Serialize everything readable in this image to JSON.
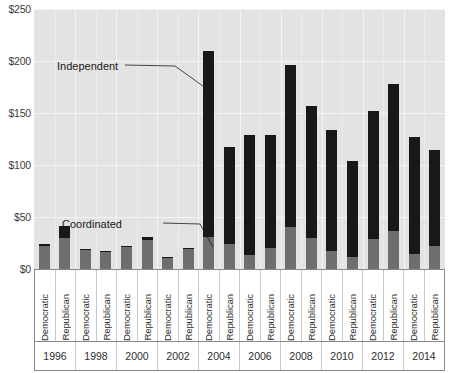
{
  "chart": {
    "type": "bar",
    "title": "",
    "xlabel": "",
    "ylabel": "",
    "axis": {
      "y_ticks": [
        "$0",
        "$50",
        "$100",
        "$150",
        "$200",
        "$250"
      ],
      "y_tick_values": [
        0,
        50,
        100,
        150,
        200,
        250
      ],
      "ylim": [
        0,
        250
      ],
      "grid": "horizontal-and-vertical"
    },
    "annotations": [
      {
        "name": "independent",
        "text": "Independent"
      },
      {
        "name": "coordinated",
        "text": "Coordinated"
      }
    ],
    "colors": {
      "independent": "#181818",
      "coordinated": "#6e6e6e",
      "plot_background": "#e3e3e3",
      "gridline": "#f4f4f4"
    }
  },
  "chart_data": {
    "type": "bar",
    "stacked": true,
    "title": "",
    "xlabel": "",
    "ylabel": "",
    "ylim": [
      0,
      250
    ],
    "ytick_labels": [
      "$0",
      "$50",
      "$100",
      "$150",
      "$200",
      "$250"
    ],
    "grid": true,
    "legend_position": "annotated-inline",
    "years": [
      "1996",
      "1998",
      "2000",
      "2002",
      "2004",
      "2006",
      "2008",
      "2010",
      "2012",
      "2014"
    ],
    "parties": [
      "Democratic",
      "Republican"
    ],
    "categories": [
      "1996 Democratic",
      "1996 Republican",
      "1998 Democratic",
      "1998 Republican",
      "2000 Democratic",
      "2000 Republican",
      "2002 Democratic",
      "2002 Republican",
      "2004 Democratic",
      "2004 Republican",
      "2006 Democratic",
      "2006 Republican",
      "2008 Democratic",
      "2008 Republican",
      "2010 Democratic",
      "2010 Republican",
      "2012 Democratic",
      "2012 Republican",
      "2014 Democratic",
      "2014 Republican"
    ],
    "series": [
      {
        "name": "Coordinated",
        "color": "#6e6e6e",
        "values": [
          22,
          30,
          18,
          16,
          21,
          28,
          11,
          19,
          31,
          24,
          13,
          20,
          40,
          30,
          17,
          12,
          29,
          37,
          14,
          22
        ]
      },
      {
        "name": "Independent",
        "color": "#181818",
        "values": [
          2,
          11,
          1,
          1,
          1,
          3,
          1,
          1,
          179,
          93,
          116,
          109,
          156,
          127,
          117,
          92,
          123,
          141,
          113,
          92
        ]
      }
    ],
    "totals": [
      24,
      41,
      19,
      17,
      22,
      31,
      12,
      20,
      210,
      117,
      129,
      129,
      196,
      157,
      134,
      104,
      152,
      178,
      127,
      114
    ]
  },
  "x_axis": {
    "party_labels": [
      "Democratic",
      "Republican",
      "Democratic",
      "Republican",
      "Democratic",
      "Republican",
      "Democratic",
      "Republican",
      "Democratic",
      "Republican",
      "Democratic",
      "Republican",
      "Democratic",
      "Republican",
      "Democratic",
      "Republican",
      "Democratic",
      "Republican",
      "Democratic",
      "Republican"
    ],
    "year_labels": [
      "1996",
      "1998",
      "2000",
      "2002",
      "2004",
      "2006",
      "2008",
      "2010",
      "2012",
      "2014"
    ]
  }
}
